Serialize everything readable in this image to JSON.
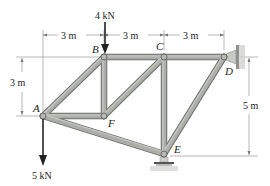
{
  "diagram": {
    "type": "truss",
    "nodes": [
      {
        "id": "A",
        "label": "A",
        "x": 43,
        "y": 116
      },
      {
        "id": "B",
        "label": "B",
        "x": 104,
        "y": 57
      },
      {
        "id": "C",
        "label": "C",
        "x": 164,
        "y": 57
      },
      {
        "id": "D",
        "label": "D",
        "x": 224,
        "y": 57
      },
      {
        "id": "E",
        "label": "E",
        "x": 164,
        "y": 154
      },
      {
        "id": "F",
        "label": "F",
        "x": 104,
        "y": 116
      }
    ],
    "members": [
      [
        "A",
        "B"
      ],
      [
        "B",
        "C"
      ],
      [
        "C",
        "D"
      ],
      [
        "B",
        "F"
      ],
      [
        "A",
        "F"
      ],
      [
        "F",
        "C"
      ],
      [
        "C",
        "E"
      ],
      [
        "D",
        "E"
      ],
      [
        "A",
        "E"
      ]
    ],
    "loads": [
      {
        "node": "B",
        "label": "4 kN",
        "direction": "down"
      },
      {
        "node": "A",
        "label": "5 kN",
        "direction": "down"
      }
    ],
    "supports": [
      {
        "node": "D",
        "type": "wall-pin"
      },
      {
        "node": "E",
        "type": "roller"
      }
    ],
    "dimensions": {
      "horizontal": [
        "3 m",
        "3 m",
        "3 m"
      ],
      "left_vertical": "3 m",
      "right_vertical": "5 m"
    }
  },
  "colors": {
    "member_fill": "#a9aba6",
    "member_edge": "#6d6f6a",
    "dim_line": "#777777",
    "arrow": "#222222",
    "support": "#8f918c"
  }
}
